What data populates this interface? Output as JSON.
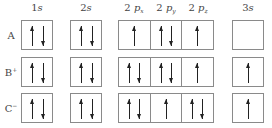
{
  "headers": {
    "s1": {
      "num": "1",
      "orb": "s"
    },
    "s2": {
      "num": "2",
      "orb": "s"
    },
    "px": {
      "num": "2",
      "orb": "p",
      "sub": "x"
    },
    "py": {
      "num": "2",
      "orb": "p",
      "sub": "y"
    },
    "pz": {
      "num": "2",
      "orb": "p",
      "sub": "z"
    },
    "s3": {
      "num": "3",
      "orb": "s"
    }
  },
  "rows": [
    {
      "label": "A",
      "charge": "",
      "orbitals": {
        "1s": "updown",
        "2s": "updown",
        "2px": "up",
        "2py": "updown",
        "2pz": "up",
        "3s": "empty"
      }
    },
    {
      "label": "B",
      "charge": "+",
      "orbitals": {
        "1s": "updown",
        "2s": "updown",
        "2px": "updown",
        "2py": "updown",
        "2pz": "up",
        "3s": "up"
      }
    },
    {
      "label": "C",
      "charge": "−",
      "orbitals": {
        "1s": "updown",
        "2s": "updown",
        "2px": "updown",
        "2py": "up",
        "2pz": "updown",
        "3s": "up"
      }
    }
  ],
  "colors": {
    "border": "#8a8a8a",
    "arrow": "#222222",
    "text": "#444444"
  }
}
